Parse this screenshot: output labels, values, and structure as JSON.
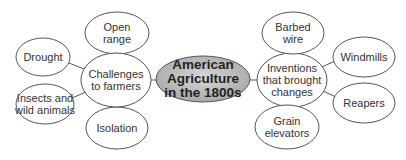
{
  "diagram": {
    "center": {
      "label": "American\nAgriculture\nin the 1800s"
    },
    "left_hub": {
      "label": "Challenges\nto farmers"
    },
    "right_hub": {
      "label": "Inventions\nthat brought\nchanges"
    },
    "left_items": [
      {
        "label": "Open\nrange"
      },
      {
        "label": "Drought"
      },
      {
        "label": "Insects and\nwild animals"
      },
      {
        "label": "Isolation"
      }
    ],
    "right_items": [
      {
        "label": "Barbed\nwire"
      },
      {
        "label": "Windmills"
      },
      {
        "label": "Reapers"
      },
      {
        "label": "Grain\nelevators"
      }
    ],
    "colors": {
      "center_fill": "#b3b3b3",
      "stroke": "#555555",
      "node_fill": "#ffffff"
    }
  }
}
